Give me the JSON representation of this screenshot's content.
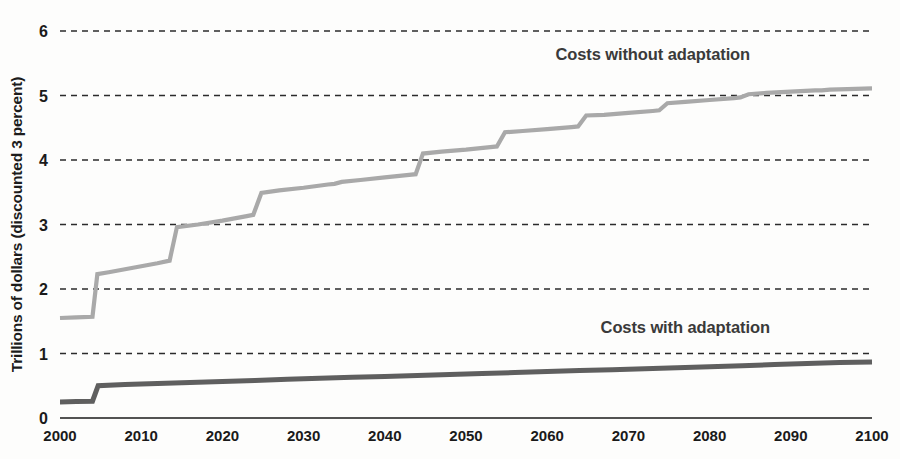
{
  "chart_data": {
    "type": "line",
    "title": "",
    "subtitle": "",
    "xlabel": "",
    "ylabel": "Trillions of dollars (discounted 3 percent)",
    "xlim": [
      2000,
      2100
    ],
    "ylim": [
      0,
      6
    ],
    "x_ticks": [
      2000,
      2010,
      2020,
      2030,
      2040,
      2050,
      2060,
      2070,
      2080,
      2090,
      2100
    ],
    "x_tick_labels": [
      "2000",
      "2010",
      "2020",
      "2030",
      "2040",
      "2050",
      "2060",
      "2070",
      "2080",
      "2090",
      "2100"
    ],
    "y_ticks": [
      0,
      1,
      2,
      3,
      4,
      5,
      6
    ],
    "y_tick_labels": [
      "0",
      "1",
      "2",
      "3",
      "4",
      "5",
      "6"
    ],
    "grid": {
      "horizontal": true,
      "vertical": false,
      "style": "dashed",
      "color": "#2b2b2b"
    },
    "legend": {
      "position": "inline-annotation",
      "entries": [
        "Costs without adaptation",
        "Costs with adaptation"
      ]
    },
    "annotations": [
      {
        "text": "Costs without adaptation",
        "x": 2073,
        "y": 5.55,
        "series": "Costs without adaptation",
        "color": "#3a3a3a"
      },
      {
        "text": "Costs with adaptation",
        "x": 2077,
        "y": 1.32,
        "series": "Costs with adaptation",
        "color": "#3a3a3a"
      }
    ],
    "series": [
      {
        "name": "Costs without adaptation",
        "color": "#a9a9a9",
        "stroke_width": 4.2,
        "x": [
          2000,
          2002,
          2004,
          2004.6,
          2006,
          2009,
          2012,
          2013.5,
          2014.4,
          2017,
          2020,
          2023,
          2023.8,
          2024.8,
          2027,
          2030,
          2033,
          2033.8,
          2034.7,
          2037,
          2040,
          2043,
          2043.8,
          2044.7,
          2047,
          2050,
          2053,
          2053.8,
          2054.8,
          2057,
          2060,
          2063,
          2063.8,
          2064.8,
          2067,
          2070,
          2073,
          2073.8,
          2074.8,
          2077,
          2080,
          2083,
          2083.8,
          2084.8,
          2087,
          2090,
          2093,
          2093.8,
          2094.8,
          2097,
          2100
        ],
        "y": [
          1.55,
          1.56,
          1.57,
          2.23,
          2.26,
          2.33,
          2.4,
          2.44,
          2.96,
          3.0,
          3.06,
          3.13,
          3.15,
          3.49,
          3.53,
          3.57,
          3.62,
          3.63,
          3.66,
          3.69,
          3.73,
          3.77,
          3.78,
          4.1,
          4.13,
          4.16,
          4.2,
          4.21,
          4.43,
          4.45,
          4.48,
          4.51,
          4.52,
          4.69,
          4.7,
          4.73,
          4.76,
          4.77,
          4.88,
          4.9,
          4.93,
          4.96,
          4.97,
          5.02,
          5.04,
          5.06,
          5.08,
          5.08,
          5.09,
          5.1,
          5.11
        ]
      },
      {
        "name": "Costs with adaptation",
        "color": "#5f5f5f",
        "stroke_width": 5.0,
        "x": [
          2000,
          2002,
          2004,
          2004.7,
          2008,
          2012,
          2016,
          2020,
          2024,
          2028,
          2032,
          2036,
          2040,
          2044,
          2048,
          2052,
          2056,
          2060,
          2064,
          2068,
          2072,
          2076,
          2080,
          2084,
          2088,
          2092,
          2096,
          2100
        ],
        "y": [
          0.25,
          0.255,
          0.26,
          0.5,
          0.52,
          0.535,
          0.55,
          0.565,
          0.58,
          0.6,
          0.615,
          0.63,
          0.645,
          0.66,
          0.675,
          0.69,
          0.705,
          0.72,
          0.735,
          0.75,
          0.765,
          0.78,
          0.795,
          0.81,
          0.83,
          0.845,
          0.86,
          0.87
        ]
      }
    ]
  },
  "plot": {
    "left": 60,
    "right": 872,
    "top": 31,
    "bottom": 418,
    "background": "#fdfdfc",
    "axis_color": "#1a1a1a"
  }
}
